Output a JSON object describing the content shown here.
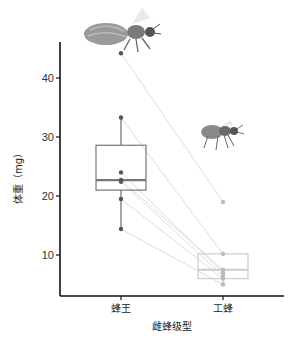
{
  "chart_data": {
    "type": "box",
    "title": "",
    "xlabel": "雌蜂级型",
    "ylabel": "体重（mg）",
    "categories": [
      "蜂王",
      "工蜂"
    ],
    "yticks": [
      10,
      20,
      30,
      40
    ],
    "ylim": [
      2,
      47
    ],
    "grid": false,
    "legend": null,
    "boxes": [
      {
        "category": "蜂王",
        "whisker_low": 14.4,
        "q1": 21.0,
        "median": 22.7,
        "q3": 28.6,
        "whisker_high": 33.3,
        "points": [
          44.2,
          33.3,
          24.0,
          22.7,
          22.4,
          19.5,
          14.4
        ]
      },
      {
        "category": "工蜂",
        "whisker_low": 5.0,
        "q1": 6.0,
        "median": 7.5,
        "q3": 10.2,
        "whisker_high": 10.2,
        "points": [
          19.0,
          10.2,
          7.5,
          7.0,
          6.5,
          6.0,
          5.0
        ]
      }
    ],
    "paired_lines": [
      [
        44.2,
        19.0
      ],
      [
        33.3,
        10.2
      ],
      [
        24.0,
        7.0
      ],
      [
        22.7,
        7.5
      ],
      [
        22.4,
        6.5
      ],
      [
        19.5,
        6.0
      ],
      [
        14.4,
        5.0
      ]
    ],
    "annotations": [
      "queen-bee-illustration",
      "worker-bee-illustration"
    ]
  },
  "colors": {
    "queen_box": "#777777",
    "worker_box": "#cccccc",
    "queen_point": "#555555",
    "worker_point": "#bbbbbb",
    "pair_line": "#dddddd",
    "axis": "#111111"
  }
}
